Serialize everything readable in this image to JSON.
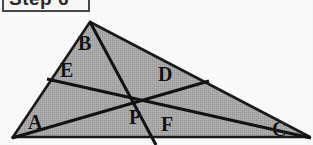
{
  "figure": {
    "caption": {
      "text": "Step 6",
      "clipped": true,
      "box_border_color": "#4a4a4a",
      "box_fill_color": "#fbfbfb"
    },
    "colors": {
      "fill": "#a8a8a8",
      "stroke": "#121212",
      "background": "#fdfdfd",
      "label": "#111111"
    },
    "shape": {
      "type": "triangle",
      "shaded": true,
      "vertices": [
        {
          "x": 90,
          "y": 22
        },
        {
          "x": 310,
          "y": 137
        },
        {
          "x": 13,
          "y": 137
        }
      ]
    },
    "interior_point": {
      "name": "P",
      "x": 140,
      "y": 98
    },
    "cevians": [
      {
        "name": "apex-to-base",
        "from": {
          "x": 90,
          "y": 22
        },
        "to": {
          "x": 156,
          "y": 145
        }
      },
      {
        "name": "left-edge-to-base",
        "from": {
          "x": 47,
          "y": 79
        },
        "to": {
          "x": 311,
          "y": 138
        }
      },
      {
        "name": "left-vertex-to-edge",
        "from": {
          "x": 12,
          "y": 138
        },
        "to": {
          "x": 209,
          "y": 81
        }
      }
    ],
    "labels": [
      {
        "id": "A",
        "text": "A",
        "x": 28,
        "y": 112
      },
      {
        "id": "B",
        "text": "B",
        "x": 78,
        "y": 33
      },
      {
        "id": "C",
        "text": "C",
        "x": 272,
        "y": 119
      },
      {
        "id": "D",
        "text": "D",
        "x": 158,
        "y": 64
      },
      {
        "id": "E",
        "text": "E",
        "x": 60,
        "y": 60
      },
      {
        "id": "F",
        "text": "F",
        "x": 161,
        "y": 114
      },
      {
        "id": "P",
        "text": "P",
        "x": 129,
        "y": 107
      }
    ]
  }
}
